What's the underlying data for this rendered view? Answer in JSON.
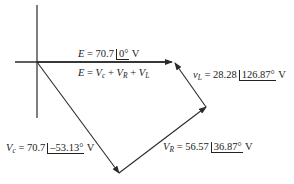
{
  "diagram": {
    "type": "phasor-diagram",
    "colors": {
      "line": "#2a2a2a",
      "text": "#222222",
      "background": "#ffffff"
    },
    "axes": {
      "origin": [
        37,
        62
      ],
      "horizontal": {
        "from": [
          15,
          62
        ],
        "to": [
          172,
          62
        ]
      },
      "vertical": {
        "from": [
          37,
          5
        ],
        "to": [
          37,
          118
        ]
      }
    },
    "labels": {
      "e_phasor": {
        "symbol": "E",
        "equals": " = ",
        "magnitude": "70.7",
        "angle": "0°",
        "unit": " V"
      },
      "kvl_equation": {
        "lhs": "E",
        "equals": " = ",
        "terms": [
          "V",
          "c",
          " + ",
          "V",
          "R",
          " + ",
          "V",
          "L"
        ]
      },
      "vl_phasor": {
        "symbol": "v",
        "sub": "L",
        "equals": " = ",
        "magnitude": "28.28",
        "angle": "126.87°",
        "unit": " V"
      },
      "vc_phasor": {
        "symbol": "V",
        "sub": "c",
        "equals": " = ",
        "magnitude": "70.7",
        "angle": "–53.13°",
        "unit": " V"
      },
      "vr_phasor": {
        "symbol": "V",
        "sub": "R",
        "equals": " = ",
        "magnitude": "56.57",
        "angle": "36.87°",
        "unit": " V"
      }
    },
    "vectors": [
      {
        "name": "E",
        "from": [
          37,
          62
        ],
        "to": [
          172,
          62
        ]
      },
      {
        "name": "Vc",
        "from": [
          37,
          62
        ],
        "to": [
          119,
          173
        ]
      },
      {
        "name": "VR",
        "from": [
          119,
          173
        ],
        "to": [
          206,
          107
        ]
      },
      {
        "name": "VL",
        "from": [
          206,
          107
        ],
        "to": [
          175,
          63
        ]
      }
    ]
  }
}
